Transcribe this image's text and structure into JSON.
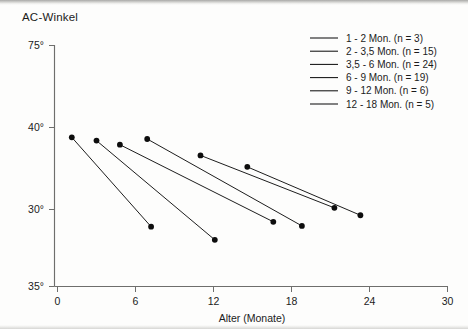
{
  "chart_data": {
    "type": "line",
    "title": "AC-Winkel",
    "xlabel": "Alter (Monate)",
    "ylabel": "AC-Winkel",
    "xlim": [
      0,
      30
    ],
    "ylim": [
      35,
      75
    ],
    "xticks": [
      "0",
      "6",
      "12",
      "18",
      "24",
      "30"
    ],
    "xtick_values": [
      0,
      6,
      12,
      18,
      24,
      30
    ],
    "yticks": [
      "75°",
      "40°",
      "30°",
      "35°"
    ],
    "ytick_values": [
      75,
      40,
      30,
      35
    ],
    "grid": false,
    "legend_position": "top-right",
    "series": [
      {
        "name": "1 - 2 Mon. (n = 3)",
        "points": [
          {
            "x": 1.1,
            "y": 38.8
          },
          {
            "x": 7.2,
            "y": 27.9
          }
        ]
      },
      {
        "name": "2 - 3,5 Mon. (n = 15)",
        "points": [
          {
            "x": 3.0,
            "y": 38.4
          },
          {
            "x": 12.1,
            "y": 26.3
          }
        ]
      },
      {
        "name": "3,5 - 6 Mon. (n = 24)",
        "points": [
          {
            "x": 4.8,
            "y": 37.9
          },
          {
            "x": 16.6,
            "y": 28.5
          }
        ]
      },
      {
        "name": "6 - 9 Mon. (n = 19)",
        "points": [
          {
            "x": 6.9,
            "y": 38.6
          },
          {
            "x": 18.8,
            "y": 28.0
          }
        ]
      },
      {
        "name": "9 - 12 Mon. (n = 6)",
        "points": [
          {
            "x": 11.0,
            "y": 36.6
          },
          {
            "x": 21.3,
            "y": 30.2
          }
        ]
      },
      {
        "name": "12 - 18 Mon. (n = 5)",
        "points": [
          {
            "x": 14.6,
            "y": 35.2
          },
          {
            "x": 23.3,
            "y": 29.3
          }
        ]
      }
    ]
  },
  "legend": {
    "entries": [
      "1 - 2 Mon. (n = 3)",
      "2 - 3,5 Mon. (n = 15)",
      "3,5 - 6 Mon. (n = 24)",
      "6 - 9 Mon. (n = 19)",
      "9 - 12 Mon. (n = 6)",
      "12 - 18 Mon. (n = 5)"
    ]
  },
  "colors": {
    "ink": "#111111",
    "axis": "#6e6e6c",
    "paper": "#fdfdfc"
  }
}
